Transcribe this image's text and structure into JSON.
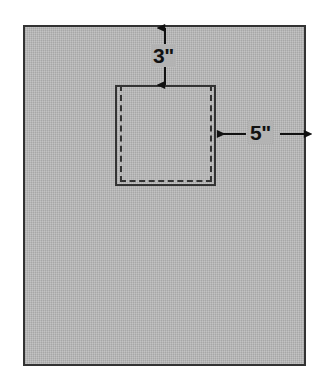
{
  "figure": {
    "background_color": "#ffffff",
    "sheet": {
      "name": "outer sheet",
      "fill_color": "#b3b3b3",
      "stroke_color": "#333333",
      "x": 23,
      "y": 25,
      "width": 283,
      "height": 341
    },
    "cutout": {
      "name": "inner square",
      "stroke_color": "#333333",
      "style": "solid",
      "x": 115,
      "y": 85,
      "width": 101,
      "height": 101
    },
    "fold_line": {
      "name": "inner dashed square",
      "stroke_color": "#333333",
      "style": "dashed",
      "x": 120,
      "y": 85,
      "width": 92,
      "height": 97
    }
  },
  "dimensions": [
    {
      "id": "top-margin",
      "label": "3\"",
      "value": 3,
      "unit": "inches",
      "orientation": "vertical",
      "from": "sheet top edge",
      "to": "square top edge",
      "arrow_x": 165,
      "arrow_y_start": 28,
      "arrow_y_end": 85
    },
    {
      "id": "right-margin",
      "label": "5\"",
      "value": 5,
      "unit": "inches",
      "orientation": "horizontal",
      "from": "square right edge",
      "to": "sheet right edge",
      "arrow_y": 134,
      "arrow_x_start": 216,
      "arrow_x_end": 304
    }
  ]
}
